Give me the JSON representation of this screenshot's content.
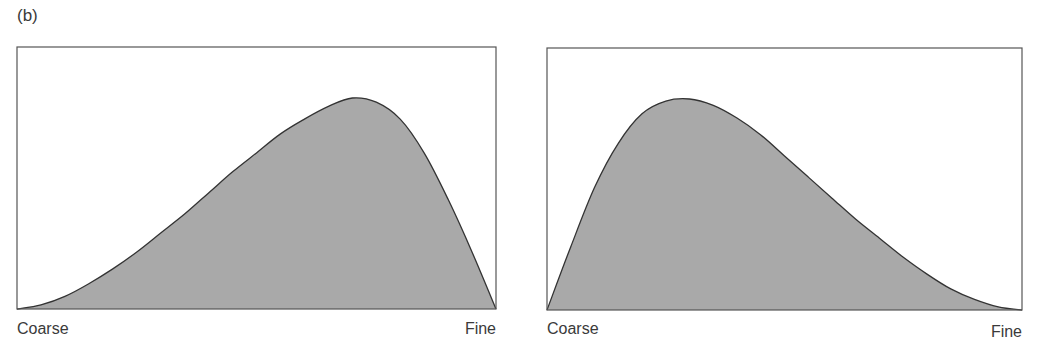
{
  "figure": {
    "panel_label": "(b)"
  },
  "colors": {
    "fill": "#a9a9a9",
    "stroke": "#333333",
    "frame": "#555555"
  },
  "chart_data": [
    {
      "type": "area",
      "title": "",
      "xlabel_left": "Coarse",
      "xlabel_right": "Fine",
      "ylabel": "",
      "xlim": [
        0,
        1
      ],
      "ylim": [
        0,
        1
      ],
      "grid": false,
      "x": [
        0,
        0.05,
        0.1,
        0.15,
        0.2,
        0.25,
        0.3,
        0.35,
        0.4,
        0.45,
        0.5,
        0.55,
        0.6,
        0.65,
        0.7,
        0.75,
        0.8,
        0.85,
        0.9,
        0.95,
        1.0
      ],
      "y": [
        0,
        0.02,
        0.06,
        0.12,
        0.19,
        0.27,
        0.36,
        0.45,
        0.55,
        0.65,
        0.74,
        0.83,
        0.9,
        0.96,
        1.0,
        0.98,
        0.9,
        0.74,
        0.52,
        0.27,
        0
      ]
    },
    {
      "type": "area",
      "title": "",
      "xlabel_left": "Coarse",
      "xlabel_right": "Fine",
      "ylabel": "",
      "xlim": [
        0,
        1
      ],
      "ylim": [
        0,
        1
      ],
      "grid": false,
      "x": [
        0,
        0.05,
        0.1,
        0.15,
        0.2,
        0.25,
        0.3,
        0.35,
        0.4,
        0.45,
        0.5,
        0.55,
        0.6,
        0.65,
        0.7,
        0.75,
        0.8,
        0.85,
        0.9,
        0.95,
        1.0
      ],
      "y": [
        0,
        0.3,
        0.58,
        0.79,
        0.93,
        0.99,
        1.0,
        0.97,
        0.91,
        0.83,
        0.73,
        0.63,
        0.53,
        0.43,
        0.34,
        0.25,
        0.17,
        0.1,
        0.05,
        0.015,
        0
      ]
    }
  ]
}
